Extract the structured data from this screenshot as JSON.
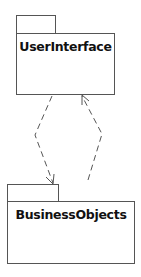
{
  "diagram": {
    "type": "uml-package-diagram",
    "packages": [
      {
        "name": "UserInterface"
      },
      {
        "name": "BusinessObjects"
      }
    ],
    "dependencies": [
      {
        "from": "UserInterface",
        "to": "BusinessObjects",
        "style": "dashed",
        "arrow": "open"
      },
      {
        "from": "BusinessObjects",
        "to": "UserInterface",
        "style": "dashed",
        "arrow": "open"
      }
    ]
  }
}
